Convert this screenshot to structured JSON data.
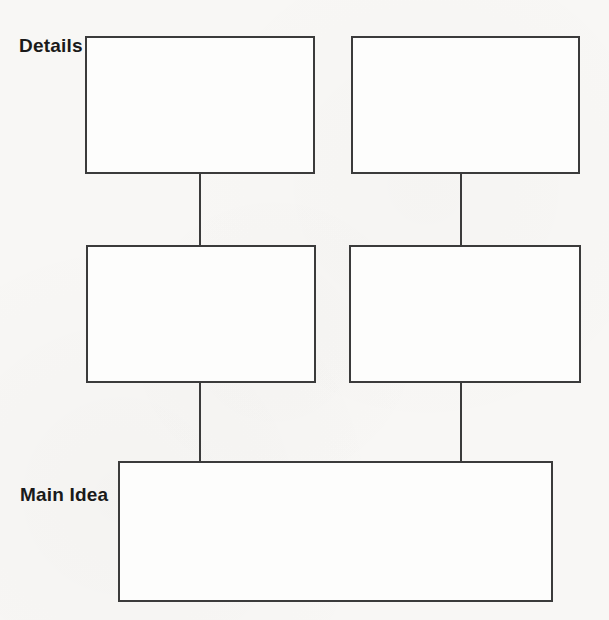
{
  "labels": {
    "details": "Details",
    "main_idea": "Main Idea"
  },
  "boxes": [
    {
      "id": "detail-1",
      "role": "detail",
      "row": "top",
      "column": "left",
      "content": ""
    },
    {
      "id": "detail-2",
      "role": "detail",
      "row": "top",
      "column": "right",
      "content": ""
    },
    {
      "id": "detail-3",
      "role": "detail",
      "row": "middle",
      "column": "left",
      "content": ""
    },
    {
      "id": "detail-4",
      "role": "detail",
      "row": "middle",
      "column": "right",
      "content": ""
    },
    {
      "id": "main",
      "role": "main-idea",
      "row": "bottom",
      "column": "center",
      "content": ""
    }
  ],
  "connectors": [
    {
      "from": "detail-1",
      "to": "detail-3"
    },
    {
      "from": "detail-2",
      "to": "detail-4"
    },
    {
      "from": "detail-3",
      "to": "main"
    },
    {
      "from": "detail-4",
      "to": "main"
    }
  ],
  "colors": {
    "line": "#3b3b3b",
    "background": "#f8f7f5",
    "box_fill": "#fdfdfc",
    "text": "#1a1a1a"
  }
}
